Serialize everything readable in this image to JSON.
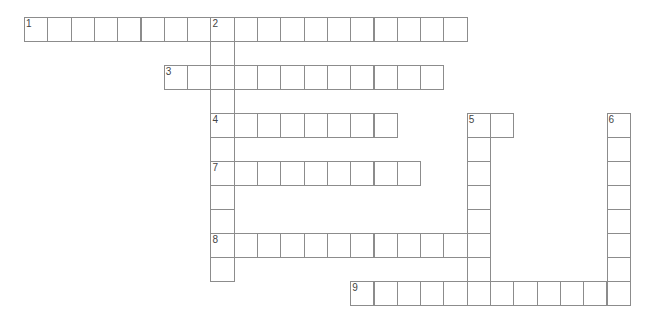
{
  "puzzle": {
    "type": "crossword",
    "origin": {
      "x": 24,
      "y": 17
    },
    "cell": {
      "w": 23.3,
      "h": 24
    },
    "border_color": "#8c8c8c",
    "entries": [
      {
        "number": "1",
        "direction": "across",
        "row": 0,
        "col": 0,
        "length": 19
      },
      {
        "number": "2",
        "direction": "down",
        "row": 0,
        "col": 8,
        "length": 11
      },
      {
        "number": "3",
        "direction": "across",
        "row": 2,
        "col": 6,
        "length": 12
      },
      {
        "number": "4",
        "direction": "across",
        "row": 4,
        "col": 8,
        "length": 8
      },
      {
        "number": "5",
        "direction": "across",
        "row": 4,
        "col": 19,
        "length": 2
      },
      {
        "number": "5",
        "direction": "down",
        "row": 4,
        "col": 19,
        "length": 8
      },
      {
        "number": "6",
        "direction": "down",
        "row": 4,
        "col": 25,
        "length": 8
      },
      {
        "number": "7",
        "direction": "across",
        "row": 6,
        "col": 8,
        "length": 9
      },
      {
        "number": "8",
        "direction": "across",
        "row": 9,
        "col": 8,
        "length": 12
      },
      {
        "number": "9",
        "direction": "across",
        "row": 11,
        "col": 14,
        "length": 12
      }
    ]
  }
}
